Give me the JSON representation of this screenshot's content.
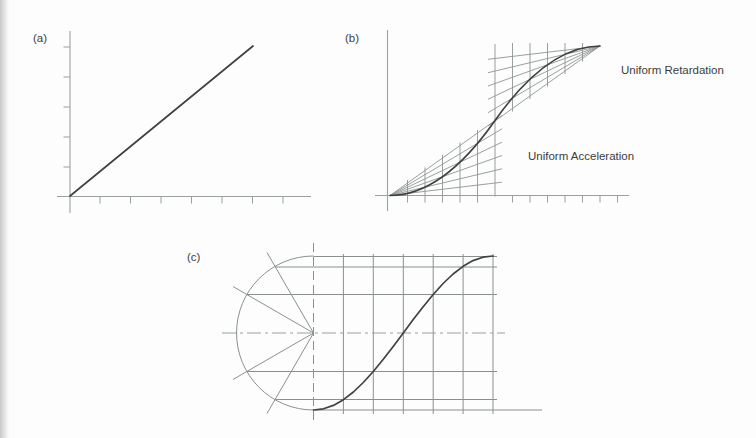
{
  "panels": {
    "a": {
      "label": "(a)"
    },
    "b": {
      "label": "(b)",
      "annotation_retardation": "Uniform Retardation",
      "annotation_acceleration": "Uniform Acceleration"
    },
    "c": {
      "label": "(c)"
    }
  },
  "colors": {
    "background": "#fdfdfd",
    "axis": "#9aa0a0",
    "construction": "#8f9494",
    "curve": "#414141",
    "text": "#3c3c3c"
  }
}
